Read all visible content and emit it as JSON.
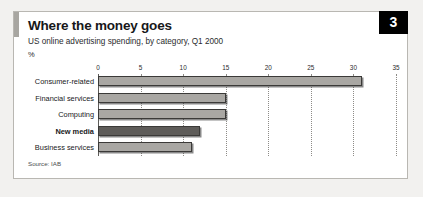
{
  "badge": {
    "number": "3"
  },
  "header": {
    "title": "Where the money goes",
    "subtitle": "US online advertising spending, by category, Q1 2000",
    "unit": "%"
  },
  "footer": {
    "source": "Source: IAB"
  },
  "chart_data": {
    "type": "bar",
    "orientation": "horizontal",
    "title": "Where the money goes",
    "subtitle": "US online advertising spending, by category, Q1 2000",
    "xlabel": "%",
    "ylabel": "",
    "xlim": [
      0,
      35
    ],
    "xticks": [
      "0",
      "5",
      "10",
      "15",
      "20",
      "25",
      "30",
      "35"
    ],
    "xtick_values": [
      0,
      5,
      10,
      15,
      20,
      25,
      30,
      35
    ],
    "grid": "vertical-dotted",
    "legend": "none",
    "source": "Source: IAB",
    "categories": [
      "Consumer-related",
      "Financial services",
      "Computing",
      "New media",
      "Business services"
    ],
    "values": [
      31,
      15,
      15,
      12,
      11
    ],
    "highlight_category": "New media",
    "colors": {
      "bar": "#a9a7a3",
      "bar_highlight": "#5e5c59",
      "bar_outline": "#3b3a38",
      "badge_background": "#000000",
      "badge_text": "#ffffff",
      "accent": "#a8a6a1",
      "panel_border": "#b9b7b2",
      "page_background": "#f2f1ef",
      "text": "#17181a"
    }
  }
}
